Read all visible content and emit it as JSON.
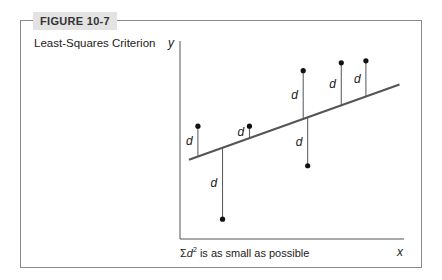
{
  "figure": {
    "label": "FIGURE 10-7",
    "title": "Least-Squares Criterion",
    "caption_prefix": "Σ",
    "caption_var": "d",
    "caption_exp": "2",
    "caption_text": " is as small as possible"
  },
  "axes": {
    "x_label": "x",
    "y_label": "y",
    "residual_label": "d"
  },
  "colors": {
    "line": "#555555",
    "point": "#111111",
    "frame": "#8a8a8a",
    "tab_bg": "#e3e3e3"
  },
  "points": [
    {
      "x": 0.08,
      "y": 0.57
    },
    {
      "x": 0.19,
      "y": 0.1
    },
    {
      "x": 0.31,
      "y": 0.57
    },
    {
      "x": 0.55,
      "y": 0.85
    },
    {
      "x": 0.57,
      "y": 0.37
    },
    {
      "x": 0.72,
      "y": 0.89
    },
    {
      "x": 0.83,
      "y": 0.9
    }
  ],
  "fit_line": {
    "x0": 0.04,
    "y0": 0.4,
    "x1": 0.98,
    "y1": 0.78
  }
}
